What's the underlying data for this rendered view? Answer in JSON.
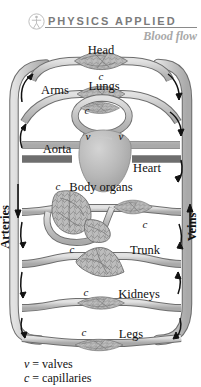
{
  "header": {
    "icon": "walking-person-icon",
    "title": "PHYSICS APPLIED",
    "subtitle": "Blood flow",
    "title_color": "#7b7b7b",
    "subtitle_color": "#a8a8a8",
    "rule_color": "#8a8a8a"
  },
  "diagram": {
    "type": "circulatory-system-schematic",
    "vessel_fill": "#c9c9c9",
    "vessel_stroke": "#6e6e6e",
    "organ_fill": "#b5b5b5",
    "arrow_color": "#111111",
    "side_labels": {
      "left": "Arteries",
      "right": "Veins"
    },
    "organ_labels": [
      {
        "name": "Head",
        "label": "Head"
      },
      {
        "name": "Arms",
        "label": "Arms"
      },
      {
        "name": "Lungs",
        "label": "Lungs"
      },
      {
        "name": "Aorta",
        "label": "Aorta"
      },
      {
        "name": "Heart",
        "label": "Heart"
      },
      {
        "name": "Body organs",
        "label": "Body organs"
      },
      {
        "name": "Trunk",
        "label": "Trunk"
      },
      {
        "name": "Kidneys",
        "label": "Kidneys"
      },
      {
        "name": "Legs",
        "label": "Legs"
      }
    ],
    "capillary_marks": [
      {
        "id": "c-head",
        "label": "c"
      },
      {
        "id": "c-arms",
        "label": "c"
      },
      {
        "id": "c-organs1",
        "label": "c"
      },
      {
        "id": "c-organs2",
        "label": "c"
      },
      {
        "id": "c-trunk",
        "label": "c"
      },
      {
        "id": "c-kidneys",
        "label": "c"
      },
      {
        "id": "c-legs",
        "label": "c"
      }
    ],
    "valve_marks": [
      {
        "id": "v-left",
        "label": "v"
      },
      {
        "id": "v-right",
        "label": "v"
      }
    ]
  },
  "legend": {
    "rows": [
      {
        "symbol": "v",
        "equals": "=",
        "text": "valves"
      },
      {
        "symbol": "c",
        "equals": "=",
        "text": "capillaries"
      }
    ]
  }
}
